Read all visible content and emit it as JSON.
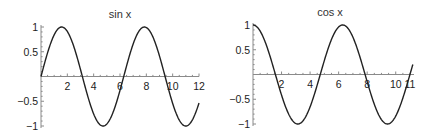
{
  "chart_data": [
    {
      "type": "line",
      "title": "sin x",
      "function": "sin",
      "xlabel": "",
      "ylabel": "",
      "xlim": [
        0,
        12
      ],
      "ylim": [
        -1,
        1
      ],
      "grid": false,
      "x_ticks": [
        2,
        4,
        6,
        8,
        10,
        12
      ],
      "x_tick_labels": [
        "2",
        "4",
        "6",
        "8",
        "10",
        "12"
      ],
      "y_ticks": [
        1,
        0.5,
        -0.5,
        -1
      ],
      "y_tick_labels": [
        "1",
        "0.5",
        "−0.5",
        "−1"
      ],
      "series": [
        {
          "name": "sin x",
          "x": [
            0,
            1,
            1.571,
            2,
            3,
            3.142,
            4,
            4.712,
            5,
            6,
            6.283,
            7,
            7.854,
            8,
            9,
            9.425,
            10,
            11,
            12
          ],
          "values": [
            0,
            0.841,
            1,
            0.909,
            0.141,
            0,
            -0.757,
            -1,
            -0.959,
            -0.279,
            0,
            0.657,
            1,
            0.989,
            0.412,
            0,
            -0.544,
            -1.0,
            -0.537
          ]
        }
      ],
      "geom": {
        "x0px": 41,
        "x1px": 199,
        "xmin": 0,
        "xmax": 12,
        "ytop": 27,
        "ybot": 126,
        "ymin": -1,
        "ymax": 1,
        "xaxis_end": 199,
        "title_x": 120,
        "title_y": 18
      }
    },
    {
      "type": "line",
      "title": "cos x",
      "function": "cos",
      "xlabel": "",
      "ylabel": "",
      "xlim": [
        0,
        11
      ],
      "ylim": [
        -1,
        1
      ],
      "grid": false,
      "x_ticks": [
        2,
        4,
        6,
        8,
        10,
        11
      ],
      "x_tick_labels": [
        "2",
        "4",
        "6",
        "8",
        "10",
        "11"
      ],
      "y_ticks": [
        1,
        0.5,
        -0.5,
        -1
      ],
      "y_tick_labels": [
        "1",
        "0.5",
        "−0.5",
        "−1"
      ],
      "series": [
        {
          "name": "cos x",
          "x": [
            0,
            1,
            1.571,
            2,
            3,
            3.142,
            4,
            4.712,
            5,
            6,
            6.283,
            7,
            7.854,
            8,
            9,
            9.425,
            10,
            10.996,
            11.2
          ],
          "values": [
            1,
            0.54,
            0,
            -0.416,
            -0.99,
            -1,
            -0.654,
            0,
            0.284,
            0.96,
            1,
            0.754,
            0,
            -0.146,
            -0.911,
            -1,
            -0.839,
            0,
            0.84
          ]
        }
      ],
      "geom": {
        "x0px": 253,
        "x1px": 410,
        "xmin": 0,
        "xmax": 11,
        "ytop": 25,
        "ybot": 124,
        "ymin": -1,
        "ymax": 1,
        "xaxis_end": 414,
        "title_x": 330,
        "title_y": 16
      }
    }
  ]
}
